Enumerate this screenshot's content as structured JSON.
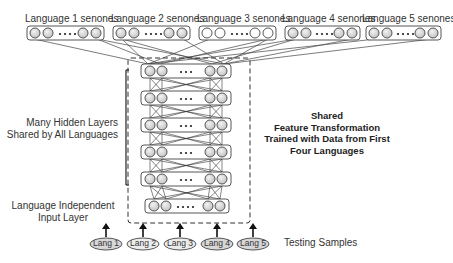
{
  "output_layers": [
    {
      "label": "Language 1 senones"
    },
    {
      "label": "Language 2 senones"
    },
    {
      "label": "Language 3 senones"
    },
    {
      "label": "Language 4 senones"
    },
    {
      "label": "Language 5 senones"
    }
  ],
  "annotations": {
    "hidden_layers_line1": "Many Hidden Layers",
    "hidden_layers_line2": "Shared by All Languages",
    "input_layer_line1": "Language Independent",
    "input_layer_line2": "Input Layer",
    "shared_line1": "Shared",
    "shared_line2": "Feature Transformation",
    "shared_line3": "Trained with Data from First",
    "shared_line4": "Four Languages",
    "testing_samples": "Testing Samples"
  },
  "inputs": [
    {
      "label": "Lang 1"
    },
    {
      "label": "Lang 2"
    },
    {
      "label": "Lang 3"
    },
    {
      "label": "Lang 4"
    },
    {
      "label": "Lang 5"
    }
  ],
  "node_glyph": "circle",
  "ellipsis": "..."
}
